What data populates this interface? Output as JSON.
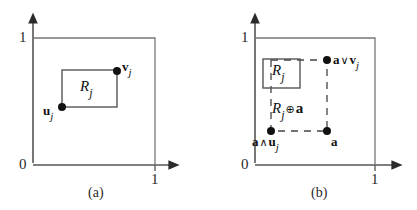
{
  "figure": {
    "title": "",
    "panels": [
      {
        "id": "a",
        "caption": "(a)",
        "axis": {
          "origin_label": "0",
          "y_top_label": "1",
          "x_right_label": "1",
          "x_axis_y": 165,
          "y_axis_x": 33,
          "unit_x": 155,
          "unit_y": 38
        },
        "rect": {
          "name": "R_j",
          "label_base": "R",
          "label_sub": "j",
          "x1": 62,
          "y1": 70,
          "x2": 117,
          "y2": 107,
          "style": "solid"
        },
        "points": [
          {
            "name": "u_j",
            "label_base": "u",
            "label_sub": "j",
            "op": "",
            "x": 62,
            "y": 107,
            "label_x": 44,
            "label_y": 106
          },
          {
            "name": "v_j",
            "label_base": "v",
            "label_sub": "j",
            "op": "",
            "x": 117,
            "y": 71,
            "label_x": 122,
            "label_y": 62
          }
        ]
      },
      {
        "id": "b",
        "caption": "(b)",
        "axis": {
          "origin_label": "0",
          "y_top_label": "1",
          "x_right_label": "1",
          "x_axis_y": 165,
          "y_axis_x": 255,
          "unit_x": 375,
          "unit_y": 38
        },
        "rect": {
          "name": "R_j",
          "label_base": "R",
          "label_sub": "j",
          "x1": 263,
          "y1": 59,
          "x2": 300,
          "y2": 88,
          "style": "solid"
        },
        "dashed_rect": {
          "name": "R_j-plus-a",
          "label_base": "R",
          "label_sub": "j",
          "op": "⊕",
          "label_tail": "a",
          "x1": 271,
          "y1": 60,
          "x2": 327,
          "y2": 131,
          "style": "dashed"
        },
        "points": [
          {
            "name": "a-meet-u_j",
            "label_prefix": "a",
            "op": "∧",
            "label_base": "u",
            "label_sub": "j",
            "x": 271,
            "y": 131,
            "label_x": 255,
            "label_y": 136
          },
          {
            "name": "a",
            "label_prefix": "",
            "op": "",
            "label_base": "a",
            "label_sub": "",
            "x": 327,
            "y": 131,
            "label_x": 331,
            "label_y": 136
          },
          {
            "name": "a-join-v_j",
            "label_prefix": "a",
            "op": "∨",
            "label_base": "v",
            "label_sub": "j",
            "x": 327,
            "y": 60,
            "label_x": 333,
            "label_y": 54
          }
        ]
      }
    ]
  },
  "colors": {
    "line": "#555555",
    "dark_line": "#333333",
    "text": "#1a1a1a",
    "background": "#ffffff"
  }
}
